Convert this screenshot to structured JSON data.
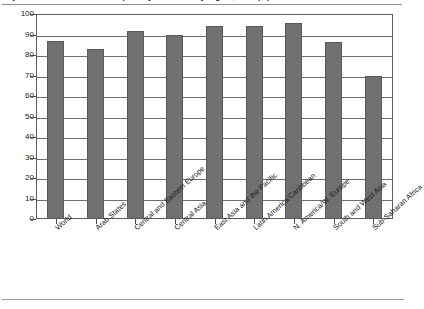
{
  "title": {
    "text": "Adjusted net enrolment rate in primary education by region, 2011 (%)",
    "clipped": true
  },
  "chart_data": {
    "type": "bar",
    "title": "Adjusted net enrolment rate in primary education by region, 2011 (%)",
    "xlabel": "",
    "ylabel": "",
    "ylim": [
      0,
      100
    ],
    "yticks": [
      0,
      10,
      20,
      30,
      40,
      50,
      60,
      70,
      80,
      90,
      100
    ],
    "grid": true,
    "legend": false,
    "legend_position": "none",
    "categories": [
      "World",
      "Arab States",
      "Central and Eastern Europe",
      "Central Asia",
      "East Asia and the Pacific",
      "Latin America/Caribbean",
      "N. America/W. Europe",
      "South and West Asia",
      "Sub-Saharan Africa"
    ],
    "values": [
      87,
      83,
      91.5,
      90,
      94,
      94,
      95.5,
      86.5,
      70
    ],
    "bar_color": "#707070",
    "bar_border_color": "#5a5a5a"
  },
  "axis": {
    "y_tick_labels": [
      "100",
      "90",
      "80",
      "70",
      "60",
      "50",
      "40",
      "30",
      "20",
      "10",
      "0"
    ]
  },
  "colors": {
    "bar": "#707070",
    "grid": "#6e6e6e",
    "frame": "#5d5d5d",
    "rule": "#9a9aa2",
    "text": "#1a1a1a"
  }
}
